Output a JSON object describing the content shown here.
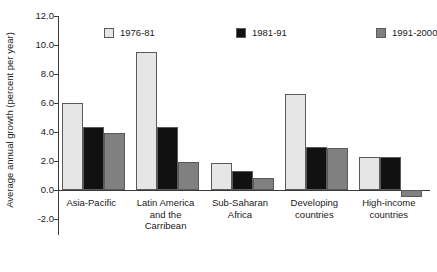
{
  "chart_data": {
    "type": "bar",
    "title": "",
    "xlabel": "",
    "ylabel": "Average annual growth (percent per year)",
    "ylim": [
      -2.0,
      12.0
    ],
    "ytick_step": 2.0,
    "ytick_labels": [
      "12.0",
      "10.0",
      "8.0",
      "6.0",
      "4.0",
      "2.0",
      "0.0",
      "-2.0"
    ],
    "ytick_values": [
      12.0,
      10.0,
      8.0,
      6.0,
      4.0,
      2.0,
      0.0,
      -2.0
    ],
    "grid": false,
    "legend_position": "top",
    "categories": [
      "Asia-Pacific",
      "Latin America\nand the\nCarribean",
      "Sub-Saharan\nAfrica",
      "Developing\ncountries",
      "High-income\ncountries"
    ],
    "series": [
      {
        "name": "1976-81",
        "color": "#e6e6e6",
        "values": [
          6.0,
          9.5,
          1.85,
          6.6,
          2.3
        ]
      },
      {
        "name": "1981-91",
        "color": "#111111",
        "values": [
          4.35,
          4.35,
          1.3,
          3.0,
          2.3
        ]
      },
      {
        "name": "1991-2000",
        "color": "#808080",
        "values": [
          3.9,
          1.95,
          0.8,
          2.9,
          -0.45
        ]
      }
    ]
  }
}
